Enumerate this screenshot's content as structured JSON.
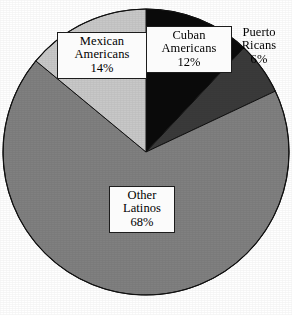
{
  "chart_data": {
    "type": "pie",
    "title": "",
    "subtitle": "",
    "xlabel": "",
    "ylabel": "",
    "legend_position": "none",
    "grid": false,
    "units": "percent",
    "total": 100,
    "start_angle_deg": 0,
    "direction": "clockwise",
    "categories": [
      "Cuban Americans",
      "Puerto Ricans",
      "Other Latinos",
      "Mexican Americans"
    ],
    "values": [
      12,
      6,
      68,
      14
    ],
    "slices": [
      {
        "id": "cuban",
        "name_line1": "Cuban",
        "name_line2": "Americans",
        "value": 12,
        "value_label": "12%",
        "color": "#0a0a0a",
        "label_boxed": true,
        "start_deg": 0,
        "end_deg": 43.2
      },
      {
        "id": "puerto-rican",
        "name_line1": "Puerto",
        "name_line2": "Ricans",
        "value": 6,
        "value_label": "6%",
        "color": "#3a3a3a",
        "label_boxed": false,
        "start_deg": 43.2,
        "end_deg": 64.8
      },
      {
        "id": "other-latinos",
        "name_line1": "Other",
        "name_line2": "Latinos",
        "value": 68,
        "value_label": "68%",
        "color": "#808080",
        "label_boxed": true,
        "start_deg": 64.8,
        "end_deg": 309.6
      },
      {
        "id": "mexican",
        "name_line1": "Mexican",
        "name_line2": "Americans",
        "value": 14,
        "value_label": "14%",
        "color": "#c8c8c8",
        "label_boxed": true,
        "start_deg": 309.6,
        "end_deg": 360
      }
    ]
  },
  "figure": {
    "background_color": "#ffffff",
    "outline_color": "#111111",
    "center_x": 146,
    "center_y": 152,
    "radius": 143
  }
}
